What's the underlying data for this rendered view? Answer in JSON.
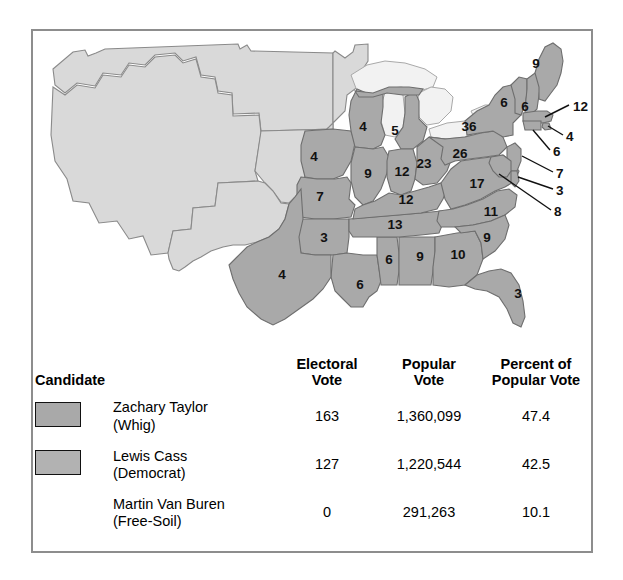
{
  "figure": {
    "kind": "electoral-map-with-results-table",
    "colors": {
      "state_dark": "#a9a9a9",
      "state_light": "#d9d9d9",
      "frame": "#8d8d8d",
      "text": "#111111",
      "background": "#ffffff"
    }
  },
  "map": {
    "title": "",
    "state_labels": [
      {
        "name": "maine",
        "abbr": "ME",
        "value": "9",
        "x": 503,
        "y": 33
      },
      {
        "name": "vermont",
        "abbr": "VT",
        "value": "6",
        "x": 471,
        "y": 72
      },
      {
        "name": "new-hampshire",
        "abbr": "NH",
        "value": "6",
        "x": 492,
        "y": 76
      },
      {
        "name": "new-york",
        "abbr": "NY",
        "value": "36",
        "x": 436,
        "y": 96
      },
      {
        "name": "pennsylvania",
        "abbr": "PA",
        "value": "26",
        "x": 427,
        "y": 123
      },
      {
        "name": "ohio",
        "abbr": "OH",
        "value": "23",
        "x": 391,
        "y": 133
      },
      {
        "name": "michigan",
        "abbr": "MI",
        "value": "5",
        "x": 362,
        "y": 100
      },
      {
        "name": "wisconsin",
        "abbr": "WI",
        "value": "4",
        "x": 330,
        "y": 96
      },
      {
        "name": "iowa",
        "abbr": "IA",
        "value": "4",
        "x": 281,
        "y": 126
      },
      {
        "name": "illinois",
        "abbr": "IL",
        "value": "9",
        "x": 335,
        "y": 143
      },
      {
        "name": "indiana",
        "abbr": "IN",
        "value": "12",
        "x": 369,
        "y": 141
      },
      {
        "name": "missouri",
        "abbr": "MO",
        "value": "7",
        "x": 287,
        "y": 166
      },
      {
        "name": "kentucky",
        "abbr": "KY",
        "value": "12",
        "x": 373,
        "y": 169
      },
      {
        "name": "virginia",
        "abbr": "VA",
        "value": "17",
        "x": 444,
        "y": 153
      },
      {
        "name": "tennessee",
        "abbr": "TN",
        "value": "13",
        "x": 362,
        "y": 194
      },
      {
        "name": "north-carolina",
        "abbr": "NC",
        "value": "11",
        "x": 458,
        "y": 181
      },
      {
        "name": "south-carolina",
        "abbr": "SC",
        "value": "9",
        "x": 454,
        "y": 207
      },
      {
        "name": "georgia",
        "abbr": "GA",
        "value": "10",
        "x": 425,
        "y": 224
      },
      {
        "name": "alabama",
        "abbr": "AL",
        "value": "9",
        "x": 387,
        "y": 226
      },
      {
        "name": "mississippi",
        "abbr": "MS",
        "value": "6",
        "x": 356,
        "y": 229
      },
      {
        "name": "louisiana",
        "abbr": "LA",
        "value": "6",
        "x": 327,
        "y": 254
      },
      {
        "name": "arkansas",
        "abbr": "AR",
        "value": "3",
        "x": 291,
        "y": 207
      },
      {
        "name": "texas",
        "abbr": "TX",
        "value": "4",
        "x": 249,
        "y": 244
      },
      {
        "name": "florida",
        "abbr": "FL",
        "value": "3",
        "x": 485,
        "y": 263
      }
    ],
    "callout_labels": [
      {
        "name": "massachusetts",
        "abbr": "MA",
        "value": "12",
        "lx": 540,
        "ly": 76,
        "tx": 512,
        "ty": 88
      },
      {
        "name": "rhode-island",
        "abbr": "RI",
        "value": "4",
        "lx": 533,
        "ly": 106,
        "tx": 508,
        "ty": 92
      },
      {
        "name": "connecticut",
        "abbr": "CT",
        "value": "6",
        "lx": 520,
        "ly": 121,
        "tx": 497,
        "ty": 101
      },
      {
        "name": "new-jersey",
        "abbr": "NJ",
        "value": "7",
        "lx": 523,
        "ly": 143,
        "tx": 490,
        "ty": 127
      },
      {
        "name": "delaware",
        "abbr": "DE",
        "value": "3",
        "lx": 523,
        "ly": 160,
        "tx": 482,
        "ty": 146
      },
      {
        "name": "maryland",
        "abbr": "MD",
        "value": "8",
        "lx": 521,
        "ly": 181,
        "tx": 466,
        "ty": 148
      }
    ]
  },
  "table": {
    "headers": {
      "candidate": "Candidate",
      "electoral_vote": "Electoral\nVote",
      "popular_vote": "Popular\nVote",
      "percent_popular_vote": "Percent of\nPopular Vote"
    },
    "rows": [
      {
        "swatch": "whig-swatch",
        "has_swatch": true,
        "candidate": "Zachary Taylor\n(Whig)",
        "electoral_vote": "163",
        "popular_vote": "1,360,099",
        "percent_popular_vote": "47.4"
      },
      {
        "swatch": "democrat-swatch",
        "has_swatch": true,
        "candidate": "Lewis Cass\n(Democrat)",
        "electoral_vote": "127",
        "popular_vote": "1,220,544",
        "percent_popular_vote": "42.5"
      },
      {
        "swatch": "none",
        "has_swatch": false,
        "candidate": "Martin Van Buren\n(Free-Soil)",
        "electoral_vote": "0",
        "popular_vote": "291,263",
        "percent_popular_vote": "10.1"
      }
    ]
  },
  "chart_data": {
    "type": "map",
    "title": "",
    "subtitle": "",
    "xlabel": "",
    "ylabel": "",
    "legend_position": "below-map",
    "grid": false,
    "categories": [
      "Zachary Taylor (Whig)",
      "Lewis Cass (Democrat)",
      "Martin Van Buren (Free-Soil)"
    ],
    "series": [
      {
        "name": "Electoral Vote",
        "values": [
          163,
          127,
          0
        ]
      },
      {
        "name": "Popular Vote",
        "values": [
          1360099,
          1220544,
          291263
        ]
      },
      {
        "name": "Percent of Popular Vote",
        "values": [
          47.4,
          42.5,
          10.1
        ]
      }
    ],
    "map_values": {
      "ME": 9,
      "VT": 6,
      "NH": 6,
      "MA": 12,
      "RI": 4,
      "CT": 6,
      "NY": 36,
      "NJ": 7,
      "PA": 26,
      "DE": 3,
      "MD": 8,
      "VA": 17,
      "NC": 11,
      "SC": 9,
      "GA": 10,
      "FL": 3,
      "AL": 9,
      "MS": 6,
      "LA": 6,
      "TX": 4,
      "AR": 3,
      "MO": 7,
      "TN": 13,
      "KY": 12,
      "OH": 23,
      "IN": 12,
      "IL": 9,
      "MI": 5,
      "WI": 4,
      "IA": 4
    },
    "annotations": [
      "Light gray western area is unorganized territory with no electoral votes."
    ]
  }
}
